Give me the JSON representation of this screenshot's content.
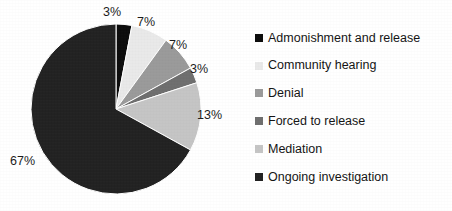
{
  "chart_data": {
    "type": "pie",
    "title": "",
    "subtitle": "",
    "xlabel": "",
    "ylabel": "",
    "grid": false,
    "legend_position": "right",
    "start_angle_deg": 0,
    "direction": "clockwise",
    "categories": [
      "Admonishment and release",
      "Community hearing",
      "Denial",
      "Forced to release",
      "Mediation",
      "Ongoing investigation"
    ],
    "values": [
      3,
      7,
      7,
      3,
      13,
      67
    ],
    "value_suffix": "%",
    "data_labels": [
      "3%",
      "7%",
      "7%",
      "3%",
      "13%",
      "67%"
    ],
    "slice_colors": [
      "#0c0c0c",
      "#e9e9e9",
      "#9a9a9a",
      "#6f6f6f",
      "#c5c5c5",
      "#222222"
    ]
  },
  "legend": {
    "items": [
      {
        "label": "Admonishment and release",
        "color": "#0c0c0c"
      },
      {
        "label": "Community hearing",
        "color": "#e9e9e9"
      },
      {
        "label": "Denial",
        "color": "#9a9a9a"
      },
      {
        "label": "Forced to release",
        "color": "#6f6f6f"
      },
      {
        "label": "Mediation",
        "color": "#c5c5c5"
      },
      {
        "label": "Ongoing investigation",
        "color": "#222222"
      }
    ]
  },
  "labels": {
    "admonishment": "3%",
    "community_hearing": "7%",
    "denial": "7%",
    "forced_to_release": "3%",
    "mediation": "13%",
    "ongoing_investigation": "67%"
  }
}
